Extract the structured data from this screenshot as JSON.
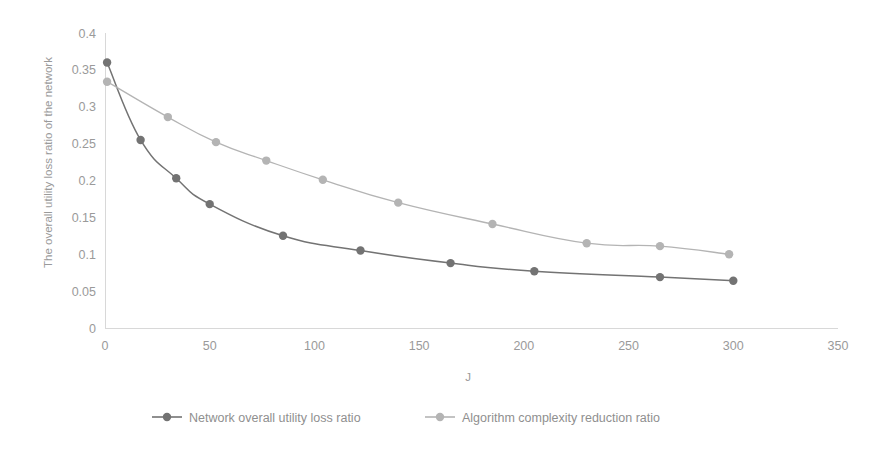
{
  "chart_data": {
    "type": "line",
    "title": "",
    "xlabel": "J",
    "ylabel": "The overall utility loss ratio of the network",
    "xlim": [
      0,
      350
    ],
    "ylim": [
      0,
      0.4
    ],
    "xticks": [
      "0",
      "50",
      "100",
      "150",
      "200",
      "250",
      "300",
      "350"
    ],
    "yticks": [
      "0",
      "0.05",
      "0.1",
      "0.15",
      "0.2",
      "0.25",
      "0.3",
      "0.35",
      "0.4"
    ],
    "grid": false,
    "legend_position": "bottom",
    "series": [
      {
        "name": "Network overall utility loss ratio",
        "color": "#737373",
        "marker": "circle",
        "x": [
          1,
          17,
          34,
          50,
          85,
          122,
          165,
          205,
          265,
          300
        ],
        "y": [
          0.36,
          0.255,
          0.203,
          0.168,
          0.125,
          0.105,
          0.088,
          0.077,
          0.069,
          0.064
        ]
      },
      {
        "name": "Algorithm complexity reduction ratio",
        "color": "#b4b4b4",
        "marker": "circle",
        "x": [
          1,
          30,
          53,
          77,
          104,
          140,
          185,
          230,
          265,
          298
        ],
        "y": [
          0.334,
          0.286,
          0.252,
          0.227,
          0.201,
          0.17,
          0.141,
          0.115,
          0.111,
          0.1
        ]
      }
    ]
  },
  "legend": {
    "items": [
      {
        "label": "Network overall utility loss ratio",
        "color": "#737373"
      },
      {
        "label": "Algorithm complexity reduction ratio",
        "color": "#b4b4b4"
      }
    ]
  },
  "axes": {
    "x_title": "J",
    "y_title": "The overall utility loss ratio of the network"
  },
  "colors": {
    "series_dark": "#737373",
    "series_light": "#b4b4b4",
    "axis": "#d8d8d8",
    "text": "#9a9a9a",
    "background": "#ffffff"
  }
}
